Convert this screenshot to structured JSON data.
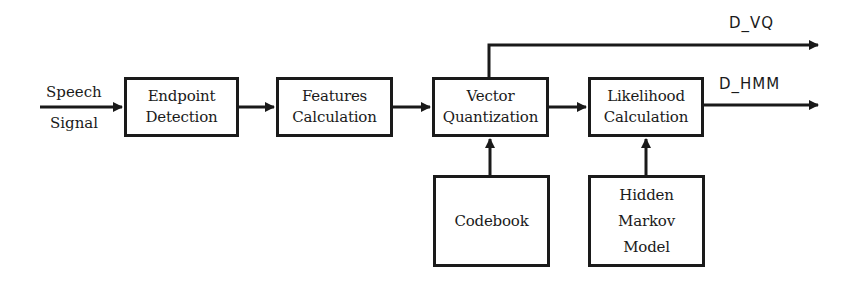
{
  "diagram": {
    "type": "block-diagram",
    "input": {
      "line1": "Speech",
      "line2": "Signal"
    },
    "blocks": [
      {
        "id": "endpoint",
        "lines": [
          "Endpoint",
          "Detection"
        ]
      },
      {
        "id": "features",
        "lines": [
          "Features",
          "Calculation"
        ]
      },
      {
        "id": "vq",
        "lines": [
          "Vector",
          "Quantization"
        ]
      },
      {
        "id": "likelihood",
        "lines": [
          "Likelihood",
          "Calculation"
        ]
      },
      {
        "id": "codebook",
        "lines": [
          "Codebook"
        ]
      },
      {
        "id": "hmm",
        "lines": [
          "Hidden",
          "Markov",
          "Model"
        ]
      }
    ],
    "outputs": {
      "vq": "D_VQ",
      "hmm": "D_HMM"
    },
    "edges": [
      [
        "input",
        "endpoint"
      ],
      [
        "endpoint",
        "features"
      ],
      [
        "features",
        "vq"
      ],
      [
        "vq",
        "likelihood"
      ],
      [
        "vq",
        "D_VQ"
      ],
      [
        "likelihood",
        "D_HMM"
      ],
      [
        "codebook",
        "vq"
      ],
      [
        "hmm",
        "likelihood"
      ]
    ],
    "colors": {
      "stroke": "#1a1a1a",
      "background": "#ffffff"
    }
  }
}
